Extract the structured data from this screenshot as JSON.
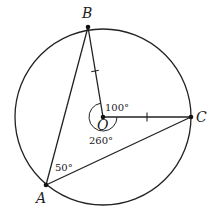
{
  "diagram": {
    "type": "circle-geometry",
    "colors": {
      "stroke": "#222222",
      "background": "#ffffff"
    },
    "circle": {
      "center": "O",
      "cx": 103,
      "cy": 117,
      "r": 88
    },
    "points": {
      "A": {
        "label": "A",
        "x": 46,
        "y": 185
      },
      "B": {
        "label": "B",
        "x": 88,
        "y": 27
      },
      "C": {
        "label": "C",
        "x": 191,
        "y": 117
      },
      "O": {
        "label": "O",
        "x": 103,
        "y": 117
      }
    },
    "segments": [
      {
        "from": "A",
        "to": "B"
      },
      {
        "from": "A",
        "to": "C"
      },
      {
        "from": "O",
        "to": "B",
        "tick_marks": 1
      },
      {
        "from": "O",
        "to": "C",
        "tick_marks": 1
      }
    ],
    "angles": {
      "BOC_minor": {
        "label": "100°",
        "vertex": "O"
      },
      "BOC_reflex": {
        "label": "260°",
        "vertex": "O"
      },
      "BAC": {
        "label": "50°",
        "vertex": "A"
      }
    }
  }
}
